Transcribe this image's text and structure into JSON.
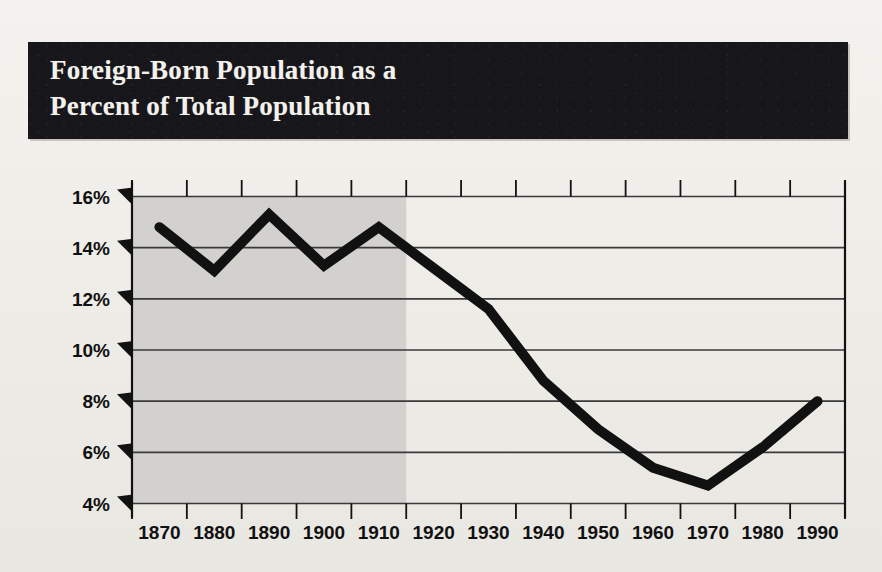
{
  "banner": {
    "title": "Foreign-Born Population as a\nPercent of Total Population",
    "background_color": "#17161a",
    "text_color": "#f3f1ec"
  },
  "page": {
    "background_color": "#f0eee9"
  },
  "chart_data": {
    "type": "line",
    "title": "Foreign-Born Population as a Percent of Total Population",
    "xlabel": "",
    "ylabel": "",
    "x": [
      1870,
      1880,
      1890,
      1900,
      1910,
      1920,
      1930,
      1940,
      1950,
      1960,
      1970,
      1980,
      1990
    ],
    "categories": [
      "1870",
      "1880",
      "1890",
      "1900",
      "1910",
      "1920",
      "1930",
      "1940",
      "1950",
      "1960",
      "1970",
      "1980",
      "1990"
    ],
    "values": [
      14.8,
      13.1,
      15.3,
      13.3,
      14.8,
      13.2,
      11.6,
      8.8,
      6.9,
      5.4,
      4.7,
      6.2,
      8.0
    ],
    "series": [
      {
        "name": "Foreign-born share of total population",
        "values": [
          14.8,
          13.1,
          15.3,
          13.3,
          14.8,
          13.2,
          11.6,
          8.8,
          6.9,
          5.4,
          4.7,
          6.2,
          8.0
        ],
        "color": "#111111",
        "line_width": 10
      }
    ],
    "ylim": [
      4,
      16
    ],
    "ytick_values": [
      16,
      14,
      12,
      10,
      8,
      6,
      4
    ],
    "ytick_labels": [
      "16%",
      "14%",
      "12%",
      "10%",
      "8%",
      "6%",
      "4%"
    ],
    "xtick_labels": [
      "1870",
      "1880",
      "1890",
      "1900",
      "1910",
      "1920",
      "1930",
      "1940",
      "1950",
      "1960",
      "1970",
      "1980",
      "1990"
    ],
    "grid": "horizontal",
    "legend": "none",
    "shaded_region": {
      "label": "",
      "from_x": 1870,
      "to_x": 1915,
      "color": "#d2d1cd"
    },
    "line_color": "#111111",
    "grid_color": "#3a3a3a",
    "axis_color": "#111111"
  }
}
